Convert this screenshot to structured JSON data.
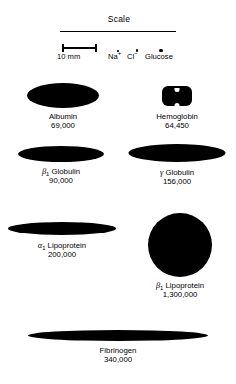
{
  "figure": {
    "background_color": "#ffffff",
    "shape_color": "#000000"
  },
  "scale": {
    "heading": "Scale",
    "bar_label": "10 mm",
    "markers": [
      {
        "name": "sodium-ion",
        "label": "Na",
        "charge": "+",
        "dot_size_px": 1.6
      },
      {
        "name": "chloride-ion",
        "label": "Cl",
        "charge": "−",
        "dot_size_px": 2.4
      },
      {
        "name": "glucose",
        "label": "Glucose",
        "charge": "",
        "dot_size_px": 3.6
      }
    ]
  },
  "molecules": [
    {
      "id": "albumin",
      "name": "Albumin",
      "prefix": "",
      "subscript": "",
      "molecular_weight": "69,000",
      "shape": "ellipse"
    },
    {
      "id": "hemoglobin",
      "name": "Hemoglobin",
      "prefix": "",
      "subscript": "",
      "molecular_weight": "64,450",
      "shape": "lobed-blob"
    },
    {
      "id": "beta1-globulin",
      "name": "Globulin",
      "prefix": "β",
      "subscript": "1",
      "molecular_weight": "90,000",
      "shape": "elongated-ellipse"
    },
    {
      "id": "gamma-globulin",
      "name": "Globulin",
      "prefix": "γ",
      "subscript": "",
      "molecular_weight": "156,000",
      "shape": "elongated-ellipse"
    },
    {
      "id": "alpha1-lipoprotein",
      "name": "Lipoprotein",
      "prefix": "α",
      "subscript": "1",
      "molecular_weight": "200,000",
      "shape": "thin-lens"
    },
    {
      "id": "beta1-lipoprotein",
      "name": "Lipoprotein",
      "prefix": "β",
      "subscript": "1",
      "molecular_weight": "1,300,000",
      "shape": "circle"
    },
    {
      "id": "fibrinogen",
      "name": "Fibrinogen",
      "prefix": "",
      "subscript": "",
      "molecular_weight": "340,000",
      "shape": "long-spindle"
    }
  ]
}
